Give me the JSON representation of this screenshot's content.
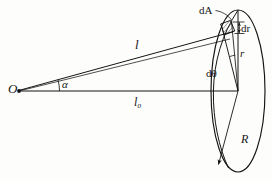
{
  "figure": {
    "background": "#fdfdfb",
    "stroke_color": "#151515",
    "width": 272,
    "height": 181,
    "labels": {
      "origin": "O",
      "angle_alpha": "α",
      "slant_distance": "l",
      "axial_distance": "l₀",
      "area_element": "dA",
      "radial_thickness": "dr",
      "radius_element": "r",
      "angle_element": "dθ",
      "disc_radius": "R"
    },
    "geometry": {
      "origin_point": [
        18,
        91
      ],
      "disc_center": [
        238,
        91
      ],
      "disc_rx": 27,
      "disc_ry": 81,
      "element_point": [
        232,
        33
      ],
      "axis_line": [
        [
          18,
          91
        ],
        [
          238,
          91
        ]
      ],
      "slant_line": [
        [
          18,
          91
        ],
        [
          232,
          33
        ]
      ],
      "radial_line": [
        [
          238,
          91
        ],
        [
          238,
          11
        ]
      ],
      "radius_arrow": [
        [
          238,
          91
        ],
        [
          218,
          166
        ]
      ],
      "hatch_angle_deg": 35
    }
  }
}
